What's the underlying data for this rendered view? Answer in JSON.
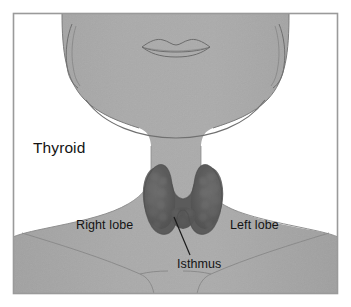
{
  "figure": {
    "view": "anterior-neck",
    "frame": {
      "border_color": "#9a9a9a",
      "background_color": "#ffffff"
    },
    "palette": {
      "skin": "#a8a8a8",
      "skin_shadow": "#9d9d9d",
      "skin_highlight": "#b2b2b2",
      "outline": "#6b6b6b",
      "thyroid": "#5e5e5e",
      "thyroid_dark": "#4a4a4a",
      "thyroid_light": "#6e6e6e",
      "leader_line": "#1a1a1a",
      "text": "#141414"
    }
  },
  "labels": {
    "thyroid": "Thyroid",
    "right_lobe": "Right lobe",
    "left_lobe": "Left lobe",
    "isthmus": "Isthmus"
  },
  "anatomy": {
    "head": "head-silhouette",
    "lips": "lips-outline",
    "left_ear": "ear-outline-left",
    "right_ear": "ear-outline-right",
    "jaw": "jawline",
    "neck": "neck",
    "clavicles": "clavicle-lines",
    "gland": "thyroid-gland"
  }
}
